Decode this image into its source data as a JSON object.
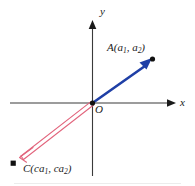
{
  "figure": {
    "type": "vector-diagram",
    "background_color": "#ffffff",
    "axes": {
      "x_label": "x",
      "y_label": "y",
      "origin_label": "O",
      "axis_color": "#3a3a3a",
      "origin_px": {
        "x": 92,
        "y": 103
      },
      "x_axis_from_px": {
        "x": 10,
        "y": 103
      },
      "x_axis_to_px": {
        "x": 174,
        "y": 103
      },
      "y_axis_from_px": {
        "x": 92,
        "y": 176
      },
      "y_axis_to_px": {
        "x": 92,
        "y": 22
      }
    },
    "vectors": [
      {
        "name": "vector-a",
        "label": "A(a",
        "label_sub1": "1",
        "label_mid": ", a",
        "label_sub2": "2",
        "label_end": ")",
        "label_full": "A(a1, a2)",
        "color": "#1f3fa6",
        "style": "solid-filled-arrow",
        "from_px": {
          "x": 92,
          "y": 103
        },
        "to_px": {
          "x": 150,
          "y": 62
        },
        "endpoint_dot_px": {
          "x": 152,
          "y": 59
        }
      },
      {
        "name": "vector-c",
        "label": "C(ca",
        "label_sub1": "1",
        "label_mid": ", ca",
        "label_sub2": "2",
        "label_end": ")",
        "label_full": "C(ca1, ca2)",
        "color": "#e2647c",
        "style": "outlined-open-arrow",
        "from_px": {
          "x": 92,
          "y": 103
        },
        "to_px": {
          "x": 20,
          "y": 157
        },
        "endpoint_dot_px": {
          "x": 13,
          "y": 163
        }
      }
    ],
    "point_dot_color": "#111111",
    "bottom_rule_color": "#e8e8e8"
  }
}
